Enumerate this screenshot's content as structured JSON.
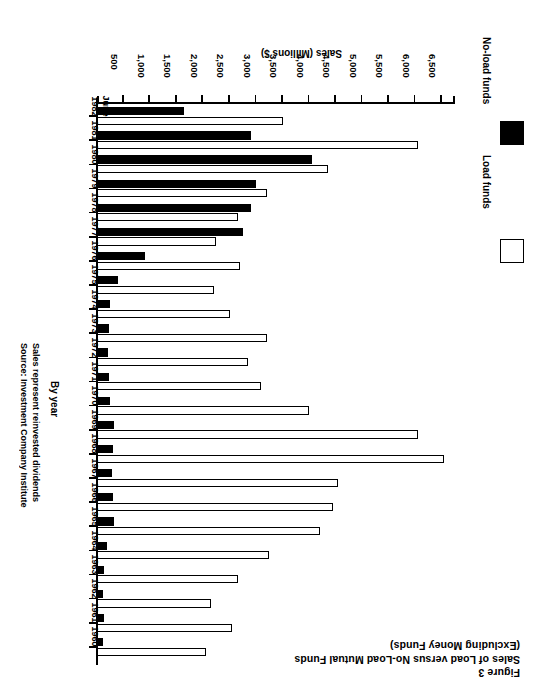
{
  "figure": {
    "label": "Figure 3",
    "title_line_1": "Sales of Load versus No-Load Mutual Funds",
    "title_line_2": "(Excluding Money Funds)"
  },
  "notes": {
    "dividends": "Sales represent reinvested dividends",
    "source": "Source: Investment Company Institute"
  },
  "legend": {
    "items": [
      {
        "label": "Load funds",
        "swatch": "white-square-icon",
        "color": "#ffffff"
      },
      {
        "label": "No-load funds",
        "swatch": "black-square-icon",
        "color": "#000000"
      }
    ]
  },
  "axes": {
    "category_title": "By year",
    "value_title": "Sales (Millions $)",
    "value_ticks": [
      "6,500",
      "6,000",
      "5,500",
      "5,000",
      "4,500",
      "4,000",
      "3,500",
      "3,000",
      "2,500",
      "2,000",
      "1,500",
      "1,000",
      "500"
    ],
    "value_min": 0,
    "value_max": 6750
  },
  "chart_data": {
    "type": "bar",
    "orientation": "horizontal",
    "title": "Sales of Load versus No-Load Mutual Funds (Excluding Money Funds)",
    "subtitle": "Figure 3",
    "xlabel": "Sales (Millions $)",
    "ylabel": "By year",
    "xlim": [
      0,
      6750
    ],
    "grid": false,
    "legend_position": "bottom-left",
    "categories": [
      "1960",
      "1961",
      "1962",
      "1963",
      "1964",
      "1965",
      "1966",
      "1967",
      "1968",
      "1969",
      "1970",
      "1971",
      "1972",
      "1973",
      "1974",
      "1975",
      "1976",
      "1977",
      "1978",
      "1979",
      "1980",
      "1981",
      "1982 June"
    ],
    "series": [
      {
        "name": "Load funds",
        "color": "#ffffff",
        "values": [
          2050,
          2550,
          2150,
          2650,
          3250,
          4200,
          4450,
          4550,
          6550,
          6050,
          4000,
          3100,
          2850,
          3200,
          2500,
          2200,
          2700,
          2250,
          2650,
          3200,
          4350,
          6050,
          3500
        ]
      },
      {
        "name": "No-load funds",
        "color": "#000000",
        "values": [
          110,
          130,
          110,
          140,
          180,
          320,
          300,
          280,
          300,
          330,
          250,
          220,
          200,
          230,
          240,
          400,
          900,
          2750,
          2900,
          3000,
          4050,
          2900,
          1650
        ]
      }
    ]
  }
}
